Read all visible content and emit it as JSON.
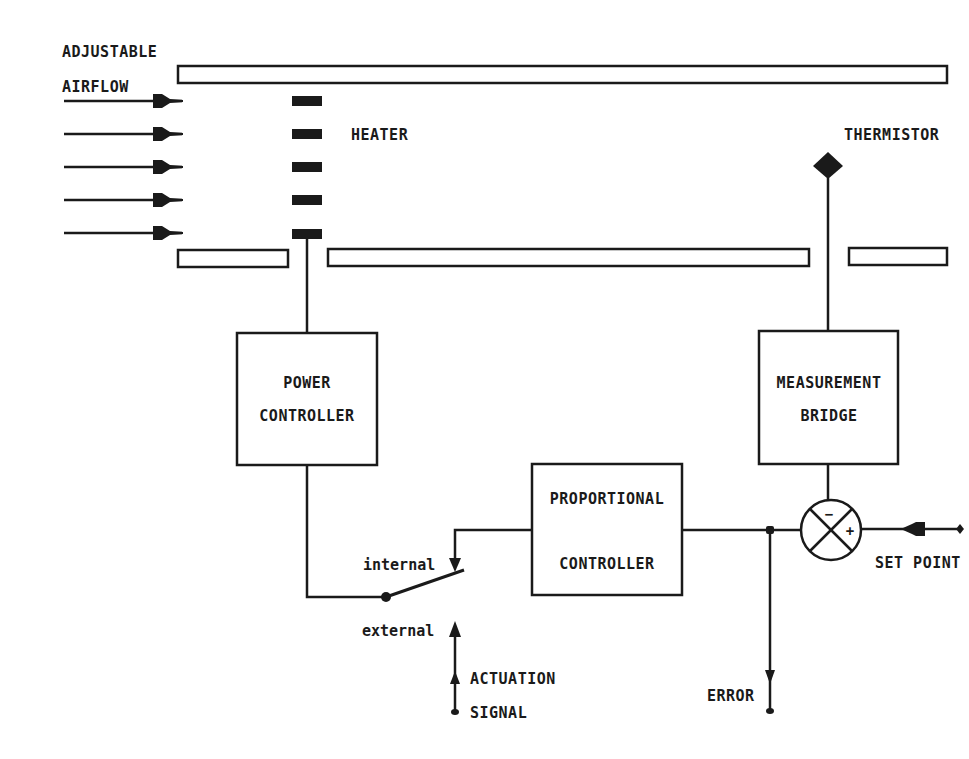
{
  "colors": {
    "ink": "#1a1a1a",
    "background": "#ffffff"
  },
  "labels": {
    "airflow_line1": "ADJUSTABLE",
    "airflow_line2": "AIRFLOW",
    "heater": "HEATER",
    "thermistor": "THERMISTOR",
    "power_controller_line1": "POWER",
    "power_controller_line2": "CONTROLLER",
    "measurement_bridge_line1": "MEASUREMENT",
    "measurement_bridge_line2": "BRIDGE",
    "proportional_controller_line1": "PROPORTIONAL",
    "proportional_controller_line2": "CONTROLLER",
    "switch_internal": "internal",
    "switch_external": "external",
    "actuation_line1": "ACTUATION",
    "actuation_line2": "SIGNAL",
    "error": "ERROR",
    "set_point": "SET POINT",
    "summing_minus": "−",
    "summing_plus": "+"
  },
  "components": {
    "airflow_arrows": 5,
    "heater_elements": 5,
    "duct_top": "single wall",
    "duct_bottom": "three wall segments"
  },
  "connections": [
    {
      "from": "heater",
      "to": "power_controller"
    },
    {
      "from": "power_controller",
      "to": "switch"
    },
    {
      "from": "proportional_controller",
      "to": "switch",
      "terminal": "internal"
    },
    {
      "from": "actuation_signal",
      "to": "switch",
      "terminal": "external"
    },
    {
      "from": "thermistor",
      "to": "measurement_bridge"
    },
    {
      "from": "measurement_bridge",
      "to": "summing_junction",
      "sign": "-"
    },
    {
      "from": "set_point",
      "to": "summing_junction",
      "sign": "+"
    },
    {
      "from": "summing_junction",
      "to": "proportional_controller"
    },
    {
      "from": "summing_junction",
      "to": "error_output"
    }
  ]
}
